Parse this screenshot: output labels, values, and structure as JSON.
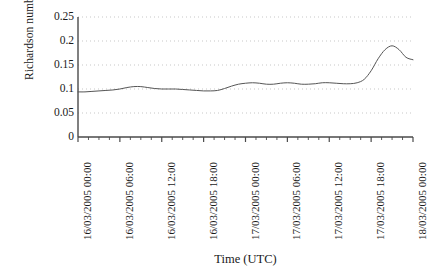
{
  "chart_data": {
    "type": "line",
    "title": "",
    "xlabel": "Time (UTC)",
    "ylabel": "Richardson number",
    "ylim": [
      0,
      0.25
    ],
    "ytick_labels": [
      "0.25",
      "0.2",
      "0.15",
      "0.1",
      "0.05",
      "0"
    ],
    "ytick_values": [
      0.25,
      0.2,
      0.15,
      0.1,
      0.05,
      0
    ],
    "xtick_labels": [
      "16/03/2005 00:00",
      "16/03/2005 06:00",
      "16/03/2005 12:00",
      "16/03/2005 18:00",
      "17/03/2005 00:00",
      "17/03/2005 06:00",
      "17/03/2005 12:00",
      "17/03/2005 18:00",
      "18/03/2005 00:00"
    ],
    "xtick_hours": [
      0,
      6,
      12,
      18,
      24,
      30,
      36,
      42,
      48
    ],
    "xlim_hours": [
      0,
      48
    ],
    "grid": true,
    "grid_style": "dotted",
    "grid_color": "#b9b9b9",
    "legend": null,
    "line_color": "#555555",
    "line_width": 1,
    "series": [
      {
        "name": "Richardson number",
        "x": [
          0,
          1,
          2,
          3,
          4,
          5,
          6,
          7,
          8,
          9,
          10,
          11,
          12,
          13,
          14,
          15,
          16,
          17,
          18,
          19,
          20,
          21,
          22,
          23,
          24,
          25,
          26,
          27,
          28,
          29,
          30,
          31,
          32,
          33,
          34,
          35,
          36,
          37,
          38,
          39,
          40,
          41,
          42,
          43,
          44,
          45,
          46,
          47,
          48
        ],
        "values": [
          0.094,
          0.094,
          0.095,
          0.096,
          0.097,
          0.098,
          0.1,
          0.103,
          0.105,
          0.105,
          0.103,
          0.101,
          0.1,
          0.1,
          0.1,
          0.099,
          0.098,
          0.097,
          0.096,
          0.096,
          0.097,
          0.101,
          0.106,
          0.11,
          0.112,
          0.113,
          0.112,
          0.11,
          0.11,
          0.112,
          0.113,
          0.112,
          0.11,
          0.11,
          0.111,
          0.113,
          0.113,
          0.112,
          0.111,
          0.111,
          0.113,
          0.12,
          0.138,
          0.163,
          0.182,
          0.19,
          0.182,
          0.166,
          0.161
        ]
      }
    ]
  }
}
